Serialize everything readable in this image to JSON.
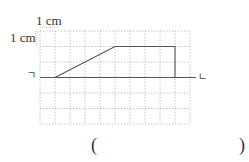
{
  "diagram": {
    "scale_labels": {
      "top": "1 cm",
      "left": "1 cm"
    },
    "grid": {
      "columns": 10,
      "rows": 6,
      "cell_unit": "1 cm",
      "line_style": "dashed",
      "line_color": "#b8b8b8"
    },
    "base_line": {
      "left_label": "ㄱ",
      "right_label": "ㄴ",
      "row": 2
    },
    "shape": {
      "description": "trapezoid-like figure drawn on the base line",
      "points_grid": [
        [
          1,
          0
        ],
        [
          4,
          2
        ],
        [
          7,
          2
        ],
        [
          7,
          0
        ]
      ],
      "stroke_color": "#555555"
    },
    "answer_blank": {
      "open": "(",
      "close": ")"
    }
  }
}
